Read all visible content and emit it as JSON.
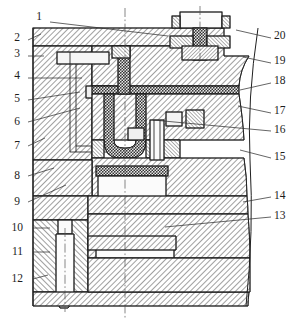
{
  "figure": {
    "caption": "",
    "view_type": "sectional-assembly-drawing",
    "part_count": 20
  },
  "callouts": {
    "left": [
      {
        "n": "1",
        "x": 42,
        "y": 17,
        "lx": 50,
        "ly": 22,
        "tx": 168,
        "ty": 36
      },
      {
        "n": "2",
        "x": 20,
        "y": 38,
        "lx": 28,
        "ly": 40,
        "tx": 41,
        "ty": 34
      },
      {
        "n": "3",
        "x": 20,
        "y": 54,
        "lx": 28,
        "ly": 56,
        "tx": 44,
        "ty": 56
      },
      {
        "n": "4",
        "x": 20,
        "y": 76,
        "lx": 28,
        "ly": 78,
        "tx": 82,
        "ty": 78
      },
      {
        "n": "5",
        "x": 20,
        "y": 99,
        "lx": 28,
        "ly": 100,
        "tx": 80,
        "ty": 92
      },
      {
        "n": "6",
        "x": 20,
        "y": 122,
        "lx": 28,
        "ly": 122,
        "tx": 80,
        "ty": 108
      },
      {
        "n": "7",
        "x": 20,
        "y": 146,
        "lx": 28,
        "ly": 146,
        "tx": 45,
        "ty": 138
      },
      {
        "n": "8",
        "x": 20,
        "y": 176,
        "lx": 28,
        "ly": 176,
        "tx": 54,
        "ty": 168
      },
      {
        "n": "9",
        "x": 20,
        "y": 202,
        "lx": 28,
        "ly": 202,
        "tx": 66,
        "ty": 185
      },
      {
        "n": "10",
        "x": 23,
        "y": 228,
        "lx": 33,
        "ly": 228,
        "tx": 50,
        "ty": 228
      },
      {
        "n": "11",
        "x": 23,
        "y": 252,
        "lx": 33,
        "ly": 252,
        "tx": 50,
        "ty": 252
      },
      {
        "n": "12",
        "x": 23,
        "y": 279,
        "lx": 33,
        "ly": 279,
        "tx": 48,
        "ty": 275
      }
    ],
    "right": [
      {
        "n": "20",
        "x": 274,
        "y": 36,
        "lx": 271,
        "ly": 38,
        "tx": 236,
        "ty": 30
      },
      {
        "n": "19",
        "x": 274,
        "y": 61,
        "lx": 271,
        "ly": 63,
        "tx": 243,
        "ty": 57
      },
      {
        "n": "18",
        "x": 274,
        "y": 81,
        "lx": 271,
        "ly": 83,
        "tx": 240,
        "ty": 90
      },
      {
        "n": "17",
        "x": 274,
        "y": 111,
        "lx": 271,
        "ly": 113,
        "tx": 238,
        "ty": 106
      },
      {
        "n": "16",
        "x": 274,
        "y": 130,
        "lx": 271,
        "ly": 131,
        "tx": 153,
        "ty": 120
      },
      {
        "n": "15",
        "x": 274,
        "y": 157,
        "lx": 271,
        "ly": 158,
        "tx": 240,
        "ty": 150
      },
      {
        "n": "14",
        "x": 274,
        "y": 196,
        "lx": 271,
        "ly": 197,
        "tx": 243,
        "ty": 202
      },
      {
        "n": "13",
        "x": 274,
        "y": 216,
        "lx": 271,
        "ly": 217,
        "tx": 165,
        "ty": 227
      }
    ]
  },
  "parts": [
    {
      "n": "1",
      "name": "top-clamping-plate"
    },
    {
      "n": "2",
      "name": "locating-ring"
    },
    {
      "n": "3",
      "name": "upper-guide-bush"
    },
    {
      "n": "4",
      "name": "side-core-slide"
    },
    {
      "n": "5",
      "name": "angle-pin"
    },
    {
      "n": "6",
      "name": "cavity-retainer-plate"
    },
    {
      "n": "7",
      "name": "mold-base-left-wall"
    },
    {
      "n": "8",
      "name": "core-retainer-plate"
    },
    {
      "n": "9",
      "name": "support-plate"
    },
    {
      "n": "10",
      "name": "spacer-block"
    },
    {
      "n": "11",
      "name": "guide-pin"
    },
    {
      "n": "12",
      "name": "bottom-clamping-plate"
    },
    {
      "n": "13",
      "name": "ejector-plate"
    },
    {
      "n": "14",
      "name": "ejector-retainer-plate"
    },
    {
      "n": "15",
      "name": "core-insert"
    },
    {
      "n": "16",
      "name": "ejector-pin"
    },
    {
      "n": "17",
      "name": "cavity-insert"
    },
    {
      "n": "18",
      "name": "parting-line-seal"
    },
    {
      "n": "19",
      "name": "upper-cavity-plate"
    },
    {
      "n": "20",
      "name": "sprue-bushing-bolt"
    }
  ],
  "colors": {
    "line": "#1f1f1f",
    "hatch": "#2a2a2a",
    "dark_fill": "#3a3a3a",
    "light_fill": "#f2f2f2",
    "page": "#ffffff"
  }
}
